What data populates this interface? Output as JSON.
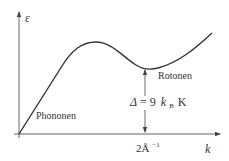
{
  "diagram": {
    "type": "dispersion-relation",
    "axes": {
      "y_label": "ε",
      "x_label": "k"
    },
    "labels": {
      "phonons": "Phononen",
      "rotons": "Rotonen",
      "gap_delta": "Δ",
      "gap_equals": "= 9",
      "gap_kb": "k",
      "gap_kb_sub": "B",
      "gap_unit": "K",
      "x_tick_value": "2Å",
      "x_tick_exp": "−1"
    },
    "colors": {
      "line": "#333333",
      "axis": "#555555",
      "background": "#ffffff"
    }
  }
}
